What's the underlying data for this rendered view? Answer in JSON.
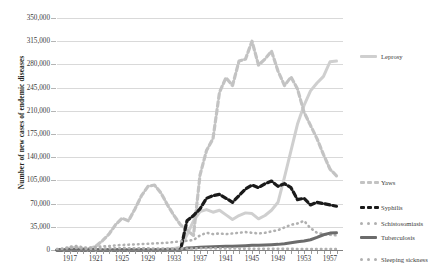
{
  "chart_data": {
    "type": "line",
    "title": "",
    "xlabel": "",
    "ylabel": "Number of new cases of endemic diseases",
    "ylim": [
      0,
      350000
    ],
    "xlim": [
      1915,
      1959
    ],
    "grid": true,
    "legend_position": "right",
    "ytick_labels": [
      "350,000",
      "315,000",
      "280,000",
      "245,000",
      "210,000",
      "175,000",
      "140,000",
      "105,000",
      "70,000",
      "35,000",
      "0"
    ],
    "ytick_values": [
      350000,
      315000,
      280000,
      245000,
      210000,
      175000,
      140000,
      105000,
      70000,
      35000,
      0
    ],
    "xtick_labels": [
      "1917",
      "1921",
      "1925",
      "1929",
      "1933",
      "1937",
      "1941",
      "1945",
      "1949",
      "1953",
      "1957"
    ],
    "xtick_values": [
      1917,
      1921,
      1925,
      1929,
      1933,
      1937,
      1941,
      1945,
      1949,
      1953,
      1957
    ],
    "x": [
      1915,
      1916,
      1917,
      1918,
      1919,
      1920,
      1921,
      1922,
      1923,
      1924,
      1925,
      1926,
      1927,
      1928,
      1929,
      1930,
      1931,
      1932,
      1933,
      1934,
      1935,
      1936,
      1937,
      1938,
      1939,
      1940,
      1941,
      1942,
      1943,
      1944,
      1945,
      1946,
      1947,
      1948,
      1949,
      1950,
      1951,
      1952,
      1953,
      1954,
      1955,
      1956,
      1957,
      1958
    ],
    "series": [
      {
        "name": "Leprosy",
        "color": "#cfcfcf",
        "style": "solid",
        "values": [
          0,
          0,
          0,
          0,
          0,
          0,
          0,
          0,
          0,
          0,
          0,
          0,
          0,
          0,
          0,
          400,
          900,
          1500,
          2400,
          4000,
          23000,
          44000,
          58000,
          61000,
          57000,
          60000,
          53000,
          46000,
          52000,
          56000,
          55000,
          47000,
          52000,
          60000,
          72000,
          110000,
          150000,
          190000,
          218000,
          240000,
          252000,
          262000,
          284000,
          285000
        ]
      },
      {
        "name": "Yaws",
        "color": "#c3c3c3",
        "style": "dashed",
        "values": [
          0,
          0,
          3000,
          3500,
          2000,
          2000,
          6000,
          14000,
          24000,
          38000,
          48000,
          44000,
          62000,
          82000,
          96000,
          98000,
          86000,
          68000,
          52000,
          38000,
          30000,
          22000,
          113000,
          150000,
          168000,
          238000,
          260000,
          248000,
          285000,
          288000,
          315000,
          279000,
          288000,
          300000,
          270000,
          248000,
          261000,
          243000,
          208000,
          188000,
          168000,
          144000,
          122000,
          112000
        ]
      },
      {
        "name": "Syphilis",
        "color": "#1a1a1a",
        "style": "dashed",
        "values": [
          0,
          0,
          0,
          0,
          0,
          0,
          0,
          0,
          0,
          0,
          0,
          0,
          0,
          0,
          0,
          0,
          0,
          0,
          0,
          0,
          44000,
          52000,
          62000,
          78000,
          82000,
          84000,
          78000,
          72000,
          82000,
          92000,
          98000,
          94000,
          100000,
          104000,
          96000,
          100000,
          94000,
          76000,
          78000,
          68000,
          72000,
          70000,
          68000,
          66000
        ]
      },
      {
        "name": "Schistosomiasis",
        "color": "#b0b0b0",
        "style": "dotted",
        "values": [
          1000,
          2000,
          5000,
          6000,
          4000,
          3500,
          4500,
          5500,
          6000,
          7000,
          7500,
          8000,
          8500,
          9000,
          9500,
          10000,
          10500,
          11000,
          12000,
          13000,
          14000,
          15000,
          22000,
          26000,
          24000,
          25000,
          24000,
          25000,
          26000,
          27000,
          26000,
          25000,
          26000,
          28000,
          30000,
          34000,
          38000,
          40000,
          44000,
          33000,
          26000,
          24000,
          23000,
          22000
        ]
      },
      {
        "name": "Tuberculosis",
        "color": "#6b6b6b",
        "style": "solid",
        "values": [
          0,
          0,
          0,
          0,
          0,
          0,
          0,
          0,
          0,
          0,
          0,
          0,
          0,
          0,
          0,
          0,
          0,
          0,
          0,
          0,
          3000,
          3500,
          4000,
          4500,
          5000,
          5200,
          5500,
          5800,
          6200,
          6500,
          7000,
          7200,
          7500,
          8000,
          8500,
          9500,
          11000,
          12500,
          13500,
          15500,
          19000,
          23000,
          25500,
          26000
        ]
      },
      {
        "name": "Sleeping sickness",
        "color": "#b0b0b0",
        "style": "dotted",
        "values": [
          1500,
          1800,
          3000,
          3200,
          2000,
          1800,
          2000,
          2200,
          2500,
          2600,
          2800,
          2700,
          2600,
          2500,
          2400,
          2300,
          2200,
          2100,
          2000,
          2000,
          2200,
          2400,
          2600,
          2600,
          2500,
          2400,
          2300,
          2200,
          2100,
          2000,
          2000,
          1900,
          1900,
          1800,
          1800,
          1700,
          1700,
          1600,
          1600,
          1500,
          1500,
          1400,
          1400,
          1300
        ]
      }
    ]
  },
  "legend": {
    "entries": [
      {
        "label": "Leprosy",
        "color": "#cfcfcf",
        "style": "solid"
      },
      {
        "label": "Yaws",
        "color": "#c3c3c3",
        "style": "dashed"
      },
      {
        "label": "Syphilis",
        "color": "#1a1a1a",
        "style": "dashed"
      },
      {
        "label": "Schistosomiasis",
        "color": "#b0b0b0",
        "style": "dotted"
      },
      {
        "label": "Tuberculosis",
        "color": "#6b6b6b",
        "style": "solid"
      },
      {
        "label": "Sleeping sickness",
        "color": "#b0b0b0",
        "style": "dotted"
      }
    ]
  }
}
